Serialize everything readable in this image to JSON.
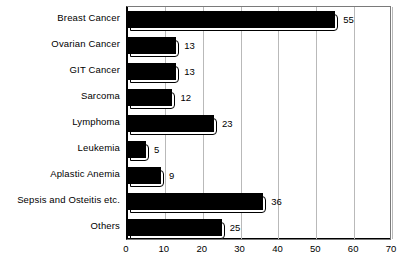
{
  "chart_data": {
    "type": "bar",
    "orientation": "horizontal",
    "title": "",
    "xlabel": "",
    "ylabel": "",
    "categories": [
      "Breast Cancer",
      "Ovarian Cancer",
      "GIT Cancer",
      "Sarcoma",
      "Lymphoma",
      "Leukemia",
      "Aplastic Anemia",
      "Sepsis and Osteitis etc.",
      "Others"
    ],
    "values": [
      55,
      13,
      13,
      12,
      23,
      5,
      9,
      36,
      25
    ],
    "value_labels": [
      "55",
      "13",
      "13",
      "12",
      "23",
      "5",
      "9",
      "36",
      "25"
    ],
    "xlim": [
      0,
      70
    ],
    "xticks": [
      0,
      10,
      20,
      30,
      40,
      50,
      60,
      70
    ],
    "xtick_labels": [
      "0",
      "10",
      "20",
      "30",
      "40",
      "50",
      "60",
      "70"
    ],
    "grid": true,
    "grid_axis": "x",
    "legend": false,
    "bar_color": "#000000",
    "shadow_color": "#ffffff",
    "grid_color": "#b9b9b9",
    "frame_color": "#7a7a7a",
    "background": "#ffffff"
  }
}
